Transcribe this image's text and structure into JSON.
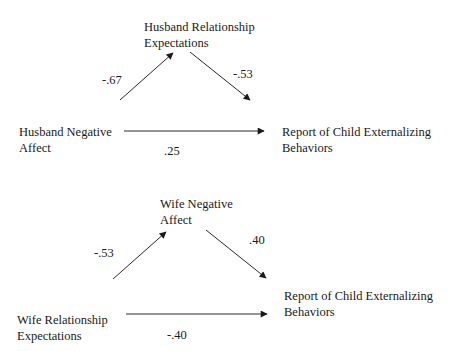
{
  "diagram_1": {
    "nodes": {
      "predictor": {
        "line1": "Husband Negative",
        "line2": "Affect"
      },
      "mediator": {
        "line1": "Husband Relationship",
        "line2": "Expectations"
      },
      "outcome": {
        "line1": "Report of Child Externalizing",
        "line2": "Behaviors"
      }
    },
    "paths": {
      "a": "-.67",
      "b": "-.53",
      "c": ".25"
    }
  },
  "diagram_2": {
    "nodes": {
      "predictor": {
        "line1": "Wife Relationship",
        "line2": "Expectations"
      },
      "mediator": {
        "line1": "Wife Negative",
        "line2": "Affect"
      },
      "outcome": {
        "line1": "Report of Child Externalizing",
        "line2": "Behaviors"
      }
    },
    "paths": {
      "a": "-.53",
      "b": ".40",
      "c": "-.40"
    }
  },
  "colors": {
    "line": "#2a2a2a",
    "text": "#1a1a1a",
    "background": "#ffffff"
  }
}
